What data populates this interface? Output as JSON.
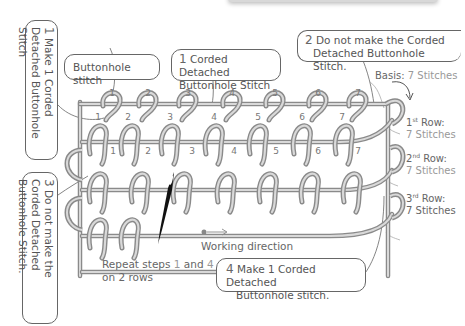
{
  "diagram": {
    "callouts": {
      "buttonhole": "Buttonhole stitch",
      "step1_num": "1",
      "step1_text": "Make 1 Corded Detached Buttonhole Stitch",
      "corded_num": "1",
      "corded_line1": "Corded Detached",
      "corded_line2": "Buttonhole Stitch",
      "step2_num": "2",
      "step2_line1": "Do not make the Corded",
      "step2_line2": "Detached Buttonhole Stitch.",
      "step3_num": "3",
      "step3_text": "Do not make the Corded Detached Buttonhole Stitch.",
      "step4_num": "4",
      "step4_line1": "Make 1 Corded Detached",
      "step4_line2": "Buttonhole stitch."
    },
    "labels": {
      "basis_prefix": "Basis:",
      "basis_value": "7 Stitches",
      "row1_title": "Row:",
      "row1_ord_num": "1",
      "row1_ord_sup": "st",
      "row1_value": "7 Stitches",
      "row2_title": "Row:",
      "row2_ord_num": "2",
      "row2_ord_sup": "nd",
      "row2_value": "7 Stitches",
      "row3_title": "Row:",
      "row3_ord_num": "3",
      "row3_ord_sup": "rd",
      "row3_value": "7 Stitches",
      "working_direction": "Working direction",
      "repeat_prefix": "Repeat steps",
      "repeat_a": "1",
      "repeat_and": "and",
      "repeat_b": "4",
      "repeat_line2": "on 2 rows"
    },
    "stitch_numbers": {
      "basis": [
        "1",
        "2",
        "3",
        "4",
        "5",
        "6",
        "7"
      ],
      "row1": [
        "1",
        "2",
        "3",
        "4",
        "5",
        "6",
        "7"
      ],
      "row2": [
        "1",
        "2",
        "3",
        "4",
        "5",
        "6",
        "7"
      ]
    },
    "colors": {
      "thread": "#8a8a8a",
      "thread_light": "#cfcfcf",
      "text": "#555555",
      "text_gray": "#999999",
      "needle": "#111111"
    }
  }
}
